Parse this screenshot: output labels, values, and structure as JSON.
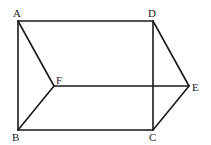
{
  "diagram": {
    "type": "geometry-figure",
    "points": {
      "A": {
        "label": "A",
        "x": 18,
        "y": 21
      },
      "D": {
        "label": "D",
        "x": 153,
        "y": 21
      },
      "F": {
        "label": "F",
        "x": 54,
        "y": 86
      },
      "E": {
        "label": "E",
        "x": 189,
        "y": 86
      },
      "B": {
        "label": "B",
        "x": 18,
        "y": 130
      },
      "C": {
        "label": "C",
        "x": 153,
        "y": 130
      }
    },
    "edges": [
      [
        "A",
        "D"
      ],
      [
        "A",
        "B"
      ],
      [
        "B",
        "C"
      ],
      [
        "D",
        "C"
      ],
      [
        "A",
        "F"
      ],
      [
        "F",
        "B"
      ],
      [
        "F",
        "E"
      ],
      [
        "D",
        "E"
      ],
      [
        "E",
        "C"
      ]
    ],
    "labels": {
      "A": "A",
      "B": "B",
      "C": "C",
      "D": "D",
      "E": "E",
      "F": "F"
    },
    "colors": {
      "stroke": "#1a1a1a",
      "background": "#ffffff"
    }
  }
}
